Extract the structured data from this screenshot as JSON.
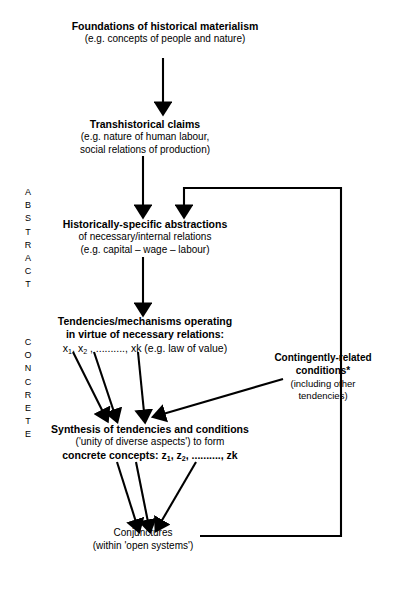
{
  "diagram": {
    "axis_labels": [
      {
        "name": "abstract",
        "text": "ABSTRACT",
        "letters": [
          "A",
          "B",
          "S",
          "T",
          "R",
          "A",
          "C",
          "T"
        ]
      },
      {
        "name": "concrete",
        "text": "CONCRETE",
        "letters": [
          "C",
          "O",
          "N",
          "C",
          "R",
          "E",
          "T",
          "E"
        ]
      }
    ],
    "nodes": [
      {
        "id": "foundations",
        "lines": [
          {
            "text": "Foundations of historical materialism",
            "bold": true
          },
          {
            "text": "(e.g. concepts of people and nature)",
            "bold": false
          }
        ]
      },
      {
        "id": "transhistorical",
        "lines": [
          {
            "text": "Transhistorical claims",
            "bold": true
          },
          {
            "text": "(e.g. nature of human labour,",
            "bold": false
          },
          {
            "text": "social relations of production)",
            "bold": false
          }
        ]
      },
      {
        "id": "historically-specific",
        "lines": [
          {
            "text": "Historically-specific abstractions",
            "bold": true
          },
          {
            "text": "of necessary/internal relations",
            "bold": false
          },
          {
            "text": "(e.g. capital – wage – labour)",
            "bold": false
          }
        ]
      },
      {
        "id": "tendencies",
        "lines": [
          {
            "text": "Tendencies/mechanisms operating",
            "bold": true
          },
          {
            "text": "in virtue of necessary relations:",
            "bold": true
          },
          {
            "text": "x1, x2 , .........., xk (e.g. law of value)",
            "bold": false
          }
        ],
        "variables": [
          "x1",
          "x2",
          "xk"
        ],
        "suffix": "(e.g. law of value)"
      },
      {
        "id": "contingent-conditions",
        "lines": [
          {
            "text": "Contingently-related",
            "bold": true
          },
          {
            "text": "conditions*",
            "bold": true
          },
          {
            "text": "(including other",
            "bold": false
          },
          {
            "text": "tendencies)",
            "bold": false
          }
        ]
      },
      {
        "id": "synthesis",
        "lines": [
          {
            "text": "Synthesis of tendencies and conditions",
            "bold": true
          },
          {
            "text": "('unity of diverse aspects') to form",
            "bold": false
          },
          {
            "text": "concrete concepts: z1, z2, .........., zk",
            "bold": true
          }
        ],
        "variables": [
          "z1",
          "z2",
          "zk"
        ],
        "prefix": "concrete concepts:"
      },
      {
        "id": "conjunctures",
        "lines": [
          {
            "text": "Conjunctures",
            "bold": false
          },
          {
            "text": "(within 'open systems')",
            "bold": false
          }
        ]
      }
    ],
    "colors": {
      "stroke": "#000000",
      "background": "#ffffff",
      "text": "#000000"
    }
  }
}
